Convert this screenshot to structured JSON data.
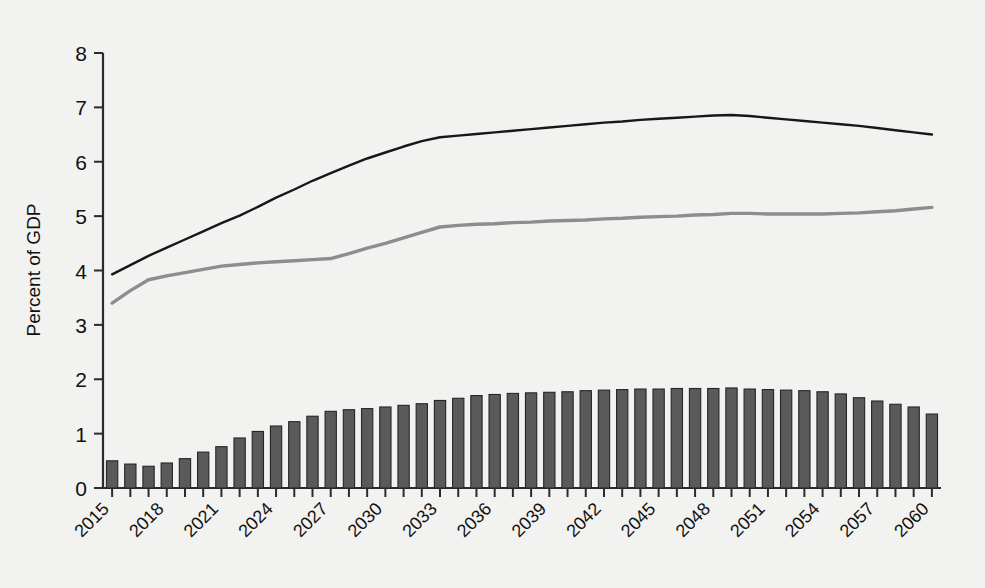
{
  "chart_data": {
    "type": "bar",
    "title": "",
    "subtitle": "",
    "xlabel": "",
    "ylabel": "Percent of GDP",
    "ylim": [
      0,
      8
    ],
    "yticks": [
      0,
      1,
      2,
      3,
      4,
      5,
      6,
      7,
      8
    ],
    "ytick_labels": [
      "0",
      "1",
      "2",
      "3",
      "4",
      "5",
      "6",
      "7",
      "8"
    ],
    "grid": false,
    "legend_position": "bottom",
    "x": [
      2015,
      2016,
      2017,
      2018,
      2019,
      2020,
      2021,
      2022,
      2023,
      2024,
      2025,
      2026,
      2027,
      2028,
      2029,
      2030,
      2031,
      2032,
      2033,
      2034,
      2035,
      2036,
      2037,
      2038,
      2039,
      2040,
      2041,
      2042,
      2043,
      2044,
      2045,
      2046,
      2047,
      2048,
      2049,
      2050,
      2051,
      2052,
      2053,
      2054,
      2055,
      2056,
      2057,
      2058,
      2059,
      2060
    ],
    "xtick_labels": [
      "2015",
      "2018",
      "2021",
      "2024",
      "2027",
      "2030",
      "2033",
      "2036",
      "2039",
      "2042",
      "2045",
      "2048",
      "2051",
      "2054",
      "2057",
      "2060"
    ],
    "xtick_values": [
      2015,
      2018,
      2021,
      2024,
      2027,
      2030,
      2033,
      2036,
      2039,
      2042,
      2045,
      2048,
      2051,
      2054,
      2057,
      2060
    ],
    "series": [
      {
        "name": "Balance",
        "type": "bar",
        "color": "#5a5a5a",
        "values": [
          0.5,
          0.44,
          0.4,
          0.46,
          0.54,
          0.66,
          0.76,
          0.92,
          1.04,
          1.14,
          1.22,
          1.32,
          1.41,
          1.44,
          1.46,
          1.49,
          1.52,
          1.55,
          1.61,
          1.65,
          1.7,
          1.72,
          1.74,
          1.75,
          1.76,
          1.77,
          1.79,
          1.8,
          1.81,
          1.82,
          1.82,
          1.83,
          1.83,
          1.83,
          1.84,
          1.82,
          1.81,
          1.8,
          1.79,
          1.77,
          1.73,
          1.66,
          1.6,
          1.54,
          1.49,
          1.36
        ]
      },
      {
        "name": "Expenditure",
        "type": "line",
        "color": "#171717",
        "values": [
          3.93,
          4.1,
          4.27,
          4.42,
          4.57,
          4.72,
          4.87,
          5.01,
          5.17,
          5.34,
          5.49,
          5.65,
          5.79,
          5.93,
          6.06,
          6.17,
          6.28,
          6.38,
          6.45,
          6.48,
          6.51,
          6.54,
          6.57,
          6.6,
          6.63,
          6.66,
          6.69,
          6.72,
          6.74,
          6.77,
          6.79,
          6.81,
          6.83,
          6.85,
          6.86,
          6.84,
          6.81,
          6.78,
          6.75,
          6.72,
          6.69,
          6.66,
          6.62,
          6.58,
          6.54,
          6.5
        ]
      },
      {
        "name": "Revenue",
        "type": "line",
        "color": "#8d8d8d",
        "values": [
          3.4,
          3.63,
          3.83,
          3.9,
          3.96,
          4.02,
          4.08,
          4.11,
          4.14,
          4.16,
          4.18,
          4.2,
          4.22,
          4.31,
          4.41,
          4.5,
          4.6,
          4.7,
          4.8,
          4.83,
          4.85,
          4.86,
          4.88,
          4.89,
          4.91,
          4.92,
          4.93,
          4.95,
          4.96,
          4.98,
          4.99,
          5.0,
          5.02,
          5.03,
          5.05,
          5.05,
          5.04,
          5.04,
          5.04,
          5.04,
          5.05,
          5.06,
          5.08,
          5.1,
          5.13,
          5.16
        ]
      }
    ]
  },
  "axis": {
    "y_label": "Percent of GDP"
  },
  "legend": {
    "items": [
      {
        "label": "Balance",
        "marker": "square-swatch",
        "color": "#5a5a5a"
      },
      {
        "label": "Expenditure",
        "marker": "line-swatch",
        "color": "#171717"
      },
      {
        "label": "Revenue",
        "marker": "line-swatch",
        "color": "#8d8d8d"
      }
    ]
  }
}
